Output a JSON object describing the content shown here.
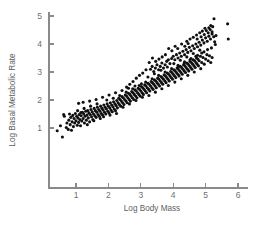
{
  "chart_data": {
    "type": "scatter",
    "title": "",
    "xlabel": "Log Body Mass",
    "ylabel": "Log Basal Metabolic Rate",
    "xlim": [
      0.3,
      6.3
    ],
    "ylim": [
      0.55,
      5.1
    ],
    "xticks": [
      1,
      2,
      3,
      4,
      5,
      6
    ],
    "yticks": [
      1,
      2,
      3,
      4,
      5
    ],
    "xtick_labels": [
      "1",
      "2",
      "3",
      "4",
      "5",
      "6"
    ],
    "ytick_labels": [
      "1",
      "2",
      "3",
      "4",
      "5"
    ],
    "grid": false,
    "legend": null,
    "marker": {
      "shape": "circle",
      "color": "#101010",
      "size": 1.55
    },
    "n_points": 356,
    "trend": {
      "slope": 0.74,
      "intercept": 0.62,
      "description": "strong positive linear relationship"
    },
    "points": [
      [
        0.42,
        0.9
      ],
      [
        0.58,
        0.68
      ],
      [
        0.52,
        1.08
      ],
      [
        0.62,
        1.48
      ],
      [
        0.64,
        1.42
      ],
      [
        0.7,
        1.02
      ],
      [
        0.72,
        1.18
      ],
      [
        0.76,
        0.95
      ],
      [
        0.78,
        1.28
      ],
      [
        0.8,
        1.5
      ],
      [
        0.82,
        1.12
      ],
      [
        0.84,
        1.38
      ],
      [
        0.86,
        0.92
      ],
      [
        0.88,
        1.22
      ],
      [
        0.9,
        1.45
      ],
      [
        0.92,
        1.05
      ],
      [
        0.94,
        1.34
      ],
      [
        0.96,
        1.18
      ],
      [
        0.98,
        1.52
      ],
      [
        1.0,
        1.26
      ],
      [
        1.02,
        1.42
      ],
      [
        1.04,
        1.1
      ],
      [
        1.06,
        1.36
      ],
      [
        1.08,
        1.2
      ],
      [
        1.1,
        1.48
      ],
      [
        1.12,
        1.3
      ],
      [
        1.14,
        1.08
      ],
      [
        1.16,
        1.44
      ],
      [
        1.18,
        1.25
      ],
      [
        1.2,
        1.56
      ],
      [
        1.22,
        1.34
      ],
      [
        1.24,
        1.5
      ],
      [
        1.26,
        1.18
      ],
      [
        1.28,
        1.42
      ],
      [
        1.3,
        1.6
      ],
      [
        1.32,
        1.28
      ],
      [
        1.34,
        1.46
      ],
      [
        1.36,
        1.62
      ],
      [
        1.38,
        1.36
      ],
      [
        1.4,
        1.54
      ],
      [
        1.42,
        1.22
      ],
      [
        1.44,
        1.48
      ],
      [
        1.46,
        1.66
      ],
      [
        1.48,
        1.4
      ],
      [
        1.5,
        1.58
      ],
      [
        1.52,
        1.3
      ],
      [
        1.54,
        1.5
      ],
      [
        1.56,
        1.7
      ],
      [
        1.58,
        1.44
      ],
      [
        1.6,
        1.62
      ],
      [
        1.62,
        1.38
      ],
      [
        1.64,
        1.56
      ],
      [
        1.66,
        1.74
      ],
      [
        1.68,
        1.48
      ],
      [
        1.7,
        1.66
      ],
      [
        1.72,
        1.42
      ],
      [
        1.74,
        1.6
      ],
      [
        1.76,
        1.78
      ],
      [
        1.78,
        1.52
      ],
      [
        1.8,
        1.7
      ],
      [
        1.82,
        1.46
      ],
      [
        1.84,
        1.64
      ],
      [
        1.86,
        1.82
      ],
      [
        1.88,
        1.56
      ],
      [
        1.9,
        1.74
      ],
      [
        1.92,
        1.5
      ],
      [
        1.94,
        1.68
      ],
      [
        1.96,
        1.86
      ],
      [
        1.98,
        1.6
      ],
      [
        2.0,
        1.78
      ],
      [
        2.02,
        1.54
      ],
      [
        2.04,
        1.72
      ],
      [
        2.06,
        1.9
      ],
      [
        2.08,
        1.64
      ],
      [
        2.1,
        1.82
      ],
      [
        2.12,
        1.58
      ],
      [
        2.14,
        1.76
      ],
      [
        2.16,
        1.94
      ],
      [
        2.18,
        1.68
      ],
      [
        2.2,
        1.86
      ],
      [
        2.22,
        1.62
      ],
      [
        2.24,
        1.8
      ],
      [
        2.26,
        1.98
      ],
      [
        2.28,
        1.72
      ],
      [
        2.3,
        1.9
      ],
      [
        2.32,
        2.06
      ],
      [
        2.34,
        1.84
      ],
      [
        2.36,
        2.02
      ],
      [
        2.38,
        1.78
      ],
      [
        2.4,
        1.96
      ],
      [
        2.42,
        2.12
      ],
      [
        2.44,
        1.9
      ],
      [
        2.46,
        2.08
      ],
      [
        2.48,
        1.84
      ],
      [
        2.5,
        2.02
      ],
      [
        2.52,
        2.18
      ],
      [
        2.54,
        1.96
      ],
      [
        2.56,
        2.14
      ],
      [
        2.58,
        1.9
      ],
      [
        2.6,
        2.08
      ],
      [
        2.62,
        2.24
      ],
      [
        2.64,
        2.02
      ],
      [
        2.66,
        2.2
      ],
      [
        2.68,
        1.96
      ],
      [
        2.7,
        2.14
      ],
      [
        2.72,
        2.3
      ],
      [
        2.74,
        2.08
      ],
      [
        2.76,
        2.26
      ],
      [
        2.78,
        2.02
      ],
      [
        2.8,
        2.2
      ],
      [
        2.82,
        2.36
      ],
      [
        2.84,
        2.14
      ],
      [
        2.86,
        2.32
      ],
      [
        2.88,
        2.08
      ],
      [
        2.9,
        2.26
      ],
      [
        2.92,
        2.42
      ],
      [
        2.94,
        2.2
      ],
      [
        2.96,
        2.38
      ],
      [
        2.98,
        2.14
      ],
      [
        3.0,
        2.32
      ],
      [
        3.02,
        2.48
      ],
      [
        3.04,
        2.26
      ],
      [
        3.06,
        2.44
      ],
      [
        3.08,
        2.2
      ],
      [
        3.1,
        2.38
      ],
      [
        3.12,
        2.54
      ],
      [
        3.14,
        2.32
      ],
      [
        3.16,
        2.5
      ],
      [
        3.18,
        2.26
      ],
      [
        3.2,
        2.44
      ],
      [
        3.22,
        2.6
      ],
      [
        3.24,
        2.38
      ],
      [
        3.26,
        2.56
      ],
      [
        3.28,
        2.32
      ],
      [
        3.3,
        2.5
      ],
      [
        3.32,
        2.66
      ],
      [
        3.34,
        2.44
      ],
      [
        3.36,
        2.62
      ],
      [
        3.38,
        2.38
      ],
      [
        3.4,
        2.56
      ],
      [
        3.42,
        2.72
      ],
      [
        3.44,
        2.5
      ],
      [
        3.46,
        2.68
      ],
      [
        3.48,
        2.44
      ],
      [
        3.5,
        2.62
      ],
      [
        3.52,
        2.78
      ],
      [
        3.54,
        2.56
      ],
      [
        3.56,
        2.74
      ],
      [
        3.58,
        2.5
      ],
      [
        3.6,
        2.68
      ],
      [
        3.62,
        2.84
      ],
      [
        3.64,
        2.62
      ],
      [
        3.66,
        2.8
      ],
      [
        3.68,
        2.56
      ],
      [
        3.7,
        2.74
      ],
      [
        3.72,
        2.9
      ],
      [
        3.74,
        2.68
      ],
      [
        3.76,
        2.86
      ],
      [
        3.78,
        2.62
      ],
      [
        3.8,
        2.8
      ],
      [
        3.82,
        2.96
      ],
      [
        3.84,
        2.74
      ],
      [
        3.86,
        2.92
      ],
      [
        3.88,
        2.68
      ],
      [
        3.9,
        2.86
      ],
      [
        3.92,
        3.02
      ],
      [
        3.94,
        2.8
      ],
      [
        3.96,
        2.98
      ],
      [
        3.98,
        2.74
      ],
      [
        4.0,
        2.92
      ],
      [
        4.02,
        3.08
      ],
      [
        4.04,
        2.86
      ],
      [
        4.06,
        3.04
      ],
      [
        4.08,
        2.8
      ],
      [
        4.1,
        2.98
      ],
      [
        4.12,
        3.14
      ],
      [
        4.14,
        2.92
      ],
      [
        4.16,
        3.1
      ],
      [
        4.18,
        2.86
      ],
      [
        4.2,
        3.04
      ],
      [
        4.22,
        3.2
      ],
      [
        4.24,
        2.98
      ],
      [
        4.26,
        3.16
      ],
      [
        4.28,
        2.92
      ],
      [
        4.3,
        3.1
      ],
      [
        4.32,
        3.26
      ],
      [
        4.34,
        3.04
      ],
      [
        4.36,
        3.22
      ],
      [
        4.38,
        2.98
      ],
      [
        4.4,
        3.16
      ],
      [
        4.42,
        3.32
      ],
      [
        4.44,
        3.1
      ],
      [
        4.46,
        3.28
      ],
      [
        4.48,
        3.04
      ],
      [
        4.5,
        3.22
      ],
      [
        4.52,
        3.38
      ],
      [
        4.54,
        3.16
      ],
      [
        4.56,
        3.34
      ],
      [
        4.58,
        3.1
      ],
      [
        4.6,
        3.28
      ],
      [
        4.62,
        3.44
      ],
      [
        4.64,
        3.22
      ],
      [
        4.66,
        3.4
      ],
      [
        4.68,
        3.16
      ],
      [
        4.7,
        3.34
      ],
      [
        4.72,
        3.5
      ],
      [
        4.74,
        3.28
      ],
      [
        4.76,
        3.46
      ],
      [
        4.78,
        3.22
      ],
      [
        4.8,
        3.4
      ],
      [
        4.84,
        3.56
      ],
      [
        4.88,
        3.34
      ],
      [
        4.92,
        3.52
      ],
      [
        4.96,
        3.28
      ],
      [
        5.0,
        3.46
      ],
      [
        5.04,
        3.62
      ],
      [
        5.08,
        3.4
      ],
      [
        5.12,
        3.58
      ],
      [
        5.16,
        3.34
      ],
      [
        5.2,
        3.52
      ],
      [
        1.05,
        1.62
      ],
      [
        1.15,
        1.55
      ],
      [
        1.25,
        1.7
      ],
      [
        1.35,
        1.12
      ],
      [
        1.45,
        1.78
      ],
      [
        1.55,
        1.26
      ],
      [
        1.65,
        1.86
      ],
      [
        1.75,
        1.34
      ],
      [
        1.85,
        1.4
      ],
      [
        1.95,
        2.0
      ],
      [
        2.05,
        1.46
      ],
      [
        2.15,
        2.06
      ],
      [
        2.25,
        1.52
      ],
      [
        2.35,
        2.16
      ],
      [
        2.45,
        1.74
      ],
      [
        2.55,
        2.28
      ],
      [
        2.65,
        1.86
      ],
      [
        2.75,
        2.4
      ],
      [
        2.85,
        1.98
      ],
      [
        2.95,
        2.52
      ],
      [
        3.05,
        2.1
      ],
      [
        3.15,
        2.64
      ],
      [
        3.25,
        2.16
      ],
      [
        3.35,
        2.76
      ],
      [
        3.45,
        2.28
      ],
      [
        3.55,
        2.88
      ],
      [
        3.65,
        2.4
      ],
      [
        3.75,
        3.0
      ],
      [
        3.85,
        2.52
      ],
      [
        3.95,
        3.12
      ],
      [
        4.05,
        2.64
      ],
      [
        4.15,
        3.24
      ],
      [
        4.25,
        2.76
      ],
      [
        4.35,
        3.36
      ],
      [
        4.45,
        2.88
      ],
      [
        4.55,
        3.48
      ],
      [
        4.65,
        3.0
      ],
      [
        4.75,
        3.6
      ],
      [
        4.85,
        3.12
      ],
      [
        4.95,
        3.72
      ],
      [
        1.08,
        1.88
      ],
      [
        1.22,
        1.92
      ],
      [
        1.42,
        1.96
      ],
      [
        1.62,
        2.02
      ],
      [
        1.82,
        2.1
      ],
      [
        2.02,
        2.18
      ],
      [
        2.22,
        2.26
      ],
      [
        2.42,
        2.34
      ],
      [
        2.62,
        2.42
      ],
      [
        2.82,
        2.5
      ],
      [
        3.02,
        2.58
      ],
      [
        3.22,
        2.82
      ],
      [
        3.42,
        2.94
      ],
      [
        3.62,
        3.06
      ],
      [
        3.82,
        3.18
      ],
      [
        4.02,
        3.3
      ],
      [
        4.22,
        3.42
      ],
      [
        4.42,
        3.54
      ],
      [
        4.62,
        3.66
      ],
      [
        4.82,
        3.78
      ],
      [
        3.3,
        3.1
      ],
      [
        3.35,
        3.2
      ],
      [
        3.4,
        3.02
      ],
      [
        3.45,
        3.14
      ],
      [
        3.5,
        3.26
      ],
      [
        3.55,
        3.08
      ],
      [
        3.6,
        3.2
      ],
      [
        3.65,
        3.32
      ],
      [
        3.7,
        3.14
      ],
      [
        3.75,
        3.26
      ],
      [
        3.8,
        3.38
      ],
      [
        3.85,
        3.44
      ],
      [
        3.9,
        3.3
      ],
      [
        3.95,
        3.48
      ],
      [
        4.0,
        3.56
      ],
      [
        4.05,
        3.44
      ],
      [
        4.1,
        3.62
      ],
      [
        4.15,
        3.5
      ],
      [
        4.2,
        3.68
      ],
      [
        4.25,
        3.56
      ],
      [
        4.3,
        3.74
      ],
      [
        4.35,
        3.62
      ],
      [
        4.4,
        3.8
      ],
      [
        4.45,
        3.7
      ],
      [
        4.5,
        3.88
      ],
      [
        4.55,
        3.76
      ],
      [
        4.6,
        3.94
      ],
      [
        4.65,
        3.84
      ],
      [
        4.7,
        4.0
      ],
      [
        4.75,
        3.9
      ],
      [
        4.8,
        4.06
      ],
      [
        4.85,
        3.96
      ],
      [
        4.9,
        4.14
      ],
      [
        4.95,
        4.04
      ],
      [
        5.0,
        4.22
      ],
      [
        5.05,
        4.1
      ],
      [
        5.1,
        4.28
      ],
      [
        5.15,
        4.18
      ],
      [
        5.2,
        4.36
      ],
      [
        5.25,
        4.26
      ],
      [
        4.42,
        4.1
      ],
      [
        4.52,
        4.18
      ],
      [
        4.62,
        4.24
      ],
      [
        4.72,
        4.32
      ],
      [
        4.82,
        4.4
      ],
      [
        4.9,
        4.46
      ],
      [
        4.96,
        4.34
      ],
      [
        5.02,
        4.48
      ],
      [
        5.08,
        4.4
      ],
      [
        5.14,
        4.52
      ],
      [
        5.2,
        4.44
      ],
      [
        5.26,
        4.9
      ],
      [
        5.22,
        4.62
      ],
      [
        5.28,
        4.08
      ],
      [
        5.32,
        4.3
      ],
      [
        5.1,
        4.58
      ],
      [
        5.16,
        4.66
      ],
      [
        4.98,
        4.56
      ],
      [
        4.86,
        4.26
      ],
      [
        4.74,
        4.18
      ],
      [
        5.68,
        4.72
      ],
      [
        5.7,
        4.18
      ],
      [
        5.3,
        3.98
      ],
      [
        5.18,
        3.86
      ],
      [
        5.06,
        3.8
      ],
      [
        4.88,
        3.68
      ],
      [
        4.7,
        3.56
      ],
      [
        4.52,
        3.44
      ],
      [
        4.34,
        3.32
      ],
      [
        4.16,
        3.2
      ],
      [
        4.46,
        4.02
      ],
      [
        4.36,
        3.92
      ],
      [
        4.26,
        4.0
      ],
      [
        4.14,
        3.84
      ],
      [
        4.06,
        3.92
      ],
      [
        3.96,
        3.76
      ],
      [
        3.86,
        3.84
      ],
      [
        3.76,
        3.62
      ],
      [
        3.66,
        3.54
      ],
      [
        3.56,
        3.46
      ],
      [
        3.46,
        3.38
      ],
      [
        3.36,
        3.5
      ],
      [
        3.26,
        3.34
      ],
      [
        3.16,
        3.08
      ],
      [
        3.06,
        2.96
      ],
      [
        2.96,
        2.88
      ],
      [
        2.86,
        2.78
      ],
      [
        2.76,
        2.66
      ],
      [
        2.66,
        2.56
      ],
      [
        2.56,
        2.46
      ]
    ]
  },
  "axes": {
    "x_label": "Log Body Mass",
    "y_label": "Log Basal Metabolic Rate",
    "x_ticks": [
      "1",
      "2",
      "3",
      "4",
      "5",
      "6"
    ],
    "y_ticks": [
      "1",
      "2",
      "3",
      "4",
      "5"
    ]
  },
  "colors": {
    "point": "#101010",
    "axis": "#8a8a8a",
    "tick_text": "#6f6f6f",
    "title_text": "#5e5e5e",
    "background": "#ffffff"
  }
}
